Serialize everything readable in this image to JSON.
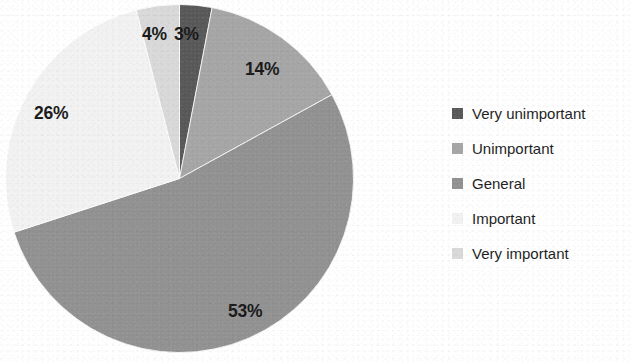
{
  "background_color": "#ffffff",
  "chart_data": {
    "type": "pie",
    "title": "",
    "subtitle": "",
    "xlabel": "",
    "ylabel": "",
    "grid": false,
    "legend_position": "right",
    "start_angle_deg": 0,
    "direction": "clockwise",
    "categories": [
      "Very unimportant",
      "Unimportant",
      "General",
      "Important",
      "Very important"
    ],
    "values": [
      3,
      14,
      53,
      26,
      4
    ],
    "unit": "%",
    "data_labels": [
      "3%",
      "14%",
      "53%",
      "26%",
      "4%"
    ],
    "colors": [
      "#595959",
      "#a6a6a6",
      "#929292",
      "#f2f2f2",
      "#d9d9d9"
    ],
    "slices": [
      {
        "label": "Very unimportant",
        "value": 3,
        "display": "3%",
        "color": "#595959"
      },
      {
        "label": "Unimportant",
        "value": 14,
        "display": "14%",
        "color": "#a6a6a6"
      },
      {
        "label": "General",
        "value": 53,
        "display": "53%",
        "color": "#929292"
      },
      {
        "label": "Important",
        "value": 26,
        "display": "26%",
        "color": "#f2f2f2"
      },
      {
        "label": "Very important",
        "value": 4,
        "display": "4%",
        "color": "#d9d9d9"
      }
    ]
  },
  "legend": {
    "items": [
      {
        "label": "Very unimportant",
        "color": "#595959"
      },
      {
        "label": "Unimportant",
        "color": "#a6a6a6"
      },
      {
        "label": "General",
        "color": "#929292"
      },
      {
        "label": "Important",
        "color": "#f2f2f2"
      },
      {
        "label": "Very important",
        "color": "#d9d9d9"
      }
    ]
  },
  "geometry": {
    "center_x": 179,
    "center_y": 178,
    "radius": 174
  }
}
